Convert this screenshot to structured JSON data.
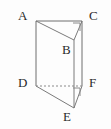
{
  "figure": {
    "name": "triangular-prism-diagram",
    "background_color": "#fdfdfd",
    "stroke_color": "#6e6e6e",
    "label_color": "#2b2b2b",
    "stroke_width": 1,
    "width": 111,
    "height": 129
  },
  "vertices": [
    {
      "id": "A",
      "label": "A",
      "x": 36,
      "y": 21,
      "label_x": 18,
      "label_y": 9
    },
    {
      "id": "B",
      "label": "B",
      "x": 74,
      "y": 40,
      "label_x": 62,
      "label_y": 43
    },
    {
      "id": "C",
      "label": "C",
      "x": 82,
      "y": 21,
      "label_x": 89,
      "label_y": 9
    },
    {
      "id": "D",
      "label": "D",
      "x": 36,
      "y": 86,
      "label_x": 18,
      "label_y": 76
    },
    {
      "id": "E",
      "label": "E",
      "x": 74,
      "y": 108,
      "label_x": 63,
      "label_y": 110
    },
    {
      "id": "F",
      "label": "F",
      "x": 82,
      "y": 86,
      "label_x": 89,
      "label_y": 76
    }
  ],
  "edges": [
    {
      "id": "AC",
      "from": "A",
      "to": "C",
      "style": "solid"
    },
    {
      "id": "AB",
      "from": "A",
      "to": "B",
      "style": "solid"
    },
    {
      "id": "BC",
      "from": "B",
      "to": "C",
      "style": "solid"
    },
    {
      "id": "AD",
      "from": "A",
      "to": "D",
      "style": "solid"
    },
    {
      "id": "BE",
      "from": "B",
      "to": "E",
      "style": "solid"
    },
    {
      "id": "CF",
      "from": "C",
      "to": "F",
      "style": "solid"
    },
    {
      "id": "DE",
      "from": "D",
      "to": "E",
      "style": "solid"
    },
    {
      "id": "EF",
      "from": "E",
      "to": "F",
      "style": "solid"
    },
    {
      "id": "DF",
      "from": "D",
      "to": "F",
      "style": "dashed"
    }
  ],
  "right_angle_marks": [
    {
      "id": "angle-at-C",
      "at": "C",
      "points": "73,22 81,22 81,31"
    },
    {
      "id": "angle-at-F",
      "at": "F",
      "points": "73,87 81,87 81,96"
    }
  ],
  "geometry_paths": {
    "top_face": "M36,21 L82,21 L74,40 Z",
    "bottom_face": "M36,86 L82,86 L74,108 Z",
    "edge_AD": "M36,21 L36,86",
    "edge_BE": "M74,40 L74,108",
    "edge_CF": "M82,21 L82,86",
    "hidden_DF": "M36,86 L82,86"
  }
}
